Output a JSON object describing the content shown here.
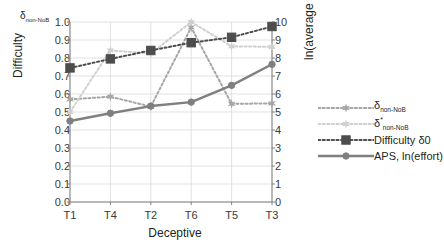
{
  "chart_data": {
    "type": "line",
    "title": "",
    "xlabel": "Deceptive",
    "ylabel": "Difficulty",
    "y2label": "ln(average effort)",
    "corner_label": "δnon-NoB",
    "categories": [
      "T1",
      "T4",
      "T2",
      "T6",
      "T5",
      "T3"
    ],
    "ylim": [
      0.0,
      1.0
    ],
    "y2lim": [
      0,
      10
    ],
    "yticks": [
      "1.0",
      "0.9",
      "0.8",
      "0.7",
      "0.6",
      "0.5",
      "0.4",
      "0.3",
      "0.2",
      "0.1",
      "0.0"
    ],
    "y2ticks": [
      "10",
      "9",
      "8",
      "7",
      "6",
      "5",
      "4",
      "3",
      "2",
      "1",
      "0"
    ],
    "grid": true,
    "legend_position": "right",
    "series": [
      {
        "name": "δnon-NoB",
        "axis": "left",
        "color": "#a6a6a6",
        "style": "dotted",
        "marker": "star",
        "values": [
          0.57,
          0.585,
          0.53,
          0.97,
          0.545,
          0.548
        ]
      },
      {
        "name": "δ*non-NoB",
        "axis": "left",
        "color": "#cfcfcf",
        "style": "dotted",
        "marker": "star",
        "values": [
          0.5,
          0.842,
          0.825,
          1.0,
          0.865,
          0.862
        ]
      },
      {
        "name": "Difficulty δ0",
        "axis": "left",
        "color": "#4d4d4d",
        "style": "dotted",
        "marker": "square",
        "values": [
          0.745,
          0.795,
          0.842,
          0.885,
          0.915,
          0.975
        ]
      },
      {
        "name": "APS, ln(effort)",
        "axis": "right",
        "color": "#7f7f7f",
        "style": "solid",
        "marker": "dot",
        "values": [
          4.5,
          4.93,
          5.33,
          5.55,
          6.48,
          7.65
        ]
      }
    ]
  },
  "legend": {
    "items": [
      {
        "label_main": "δ",
        "label_sub": "non-NoB",
        "label_sup": ""
      },
      {
        "label_main": "δ",
        "label_sub": "non-NoB",
        "label_sup": "*"
      },
      {
        "label_main": "Difficulty δ0",
        "label_sub": "",
        "label_sup": ""
      },
      {
        "label_main": "APS, ln(effort)",
        "label_sub": "",
        "label_sup": ""
      }
    ]
  },
  "colors": {
    "axis": "#808080",
    "grid": "#d9d9d9",
    "text": "#231f20"
  }
}
